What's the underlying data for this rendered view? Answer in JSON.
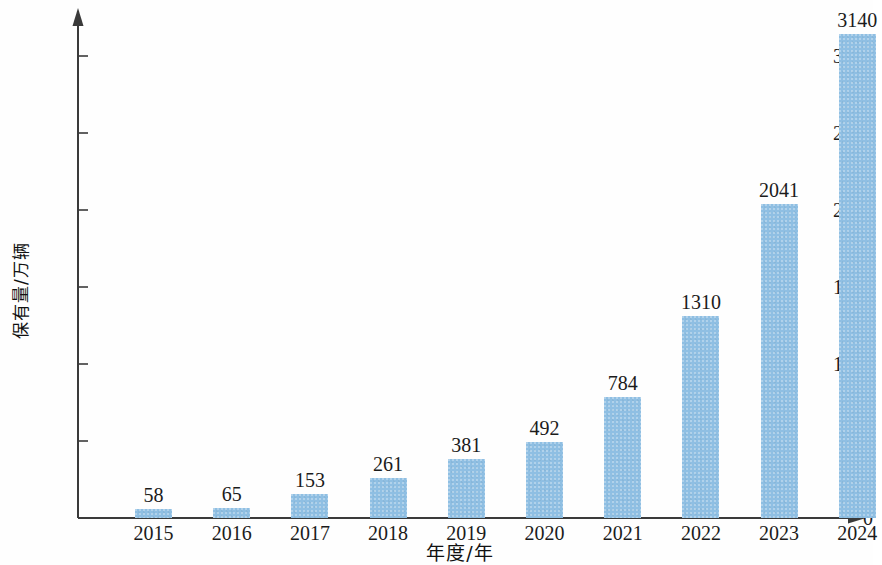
{
  "chart_data": {
    "type": "bar",
    "title": "",
    "subtitle": "",
    "xlabel": "年度/年",
    "ylabel": "保有量/万辆",
    "categories": [
      "2015",
      "2016",
      "2017",
      "2018",
      "2019",
      "2020",
      "2021",
      "2022",
      "2023",
      "2024"
    ],
    "values": [
      58,
      65,
      153,
      261,
      381,
      492,
      784,
      1310,
      2041,
      3140
    ],
    "value_labels": [
      "58",
      "65",
      "153",
      "261",
      "381",
      "492",
      "784",
      "1310",
      "2041",
      "3140"
    ],
    "series": [
      {
        "name": "保有量",
        "values": [
          58,
          65,
          153,
          261,
          381,
          492,
          784,
          1310,
          2041,
          3140
        ]
      }
    ],
    "ylim": [
      0,
      3250
    ],
    "y_ticks": [
      0,
      500,
      1000,
      1500,
      2000,
      2500,
      3000
    ],
    "y_tick_labels": [
      "0",
      "500",
      "1000",
      "1500",
      "2000",
      "2500",
      "3000"
    ],
    "grid": false,
    "legend": false,
    "legend_position": "none",
    "bar_color": "#8fbfe3",
    "axis_color": "#3a3a3a",
    "text_color": "#1b1b1b",
    "background_color": "#fefefe",
    "axis_style": "arrow-terminated",
    "data_labels_shown": true,
    "bar_width_px": 37
  }
}
